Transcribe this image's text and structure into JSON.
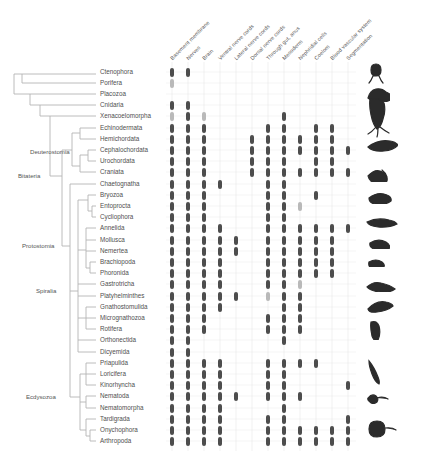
{
  "figure": {
    "type": "character-matrix-phylogeny",
    "colors": {
      "present": "#4d4d4d",
      "partial": "#b9b9b9",
      "tree": "#b0b0b0",
      "grid": "#e3e3e3",
      "text": "#4f4f4f",
      "silhouette": "#2b2b2b"
    }
  },
  "columns": [
    {
      "id": "basement-membrane",
      "label": "Basement membrane"
    },
    {
      "id": "nerves",
      "label": "Nerves"
    },
    {
      "id": "brain",
      "label": "Brain"
    },
    {
      "id": "ventral-nerve-cords",
      "label": "Ventral nerve cords"
    },
    {
      "id": "lateral-nerve-cords",
      "label": "Lateral nerve cords"
    },
    {
      "id": "dorsal-nerve-cords",
      "label": "Dorsal nerve cords"
    },
    {
      "id": "through-gut-anus",
      "label": "Through gut, anus"
    },
    {
      "id": "mesoderm",
      "label": "Mesoderm"
    },
    {
      "id": "nephridial-cells",
      "label": "Nephridial cells"
    },
    {
      "id": "coelom",
      "label": "Coelom"
    },
    {
      "id": "blood-vascular-system",
      "label": "Blood vascular system"
    },
    {
      "id": "segmentation",
      "label": "Segmentation"
    }
  ],
  "clades": [
    {
      "label": "Deuterostomia",
      "x": 30,
      "y": 152
    },
    {
      "label": "Bitateria",
      "x": 18,
      "y": 176
    },
    {
      "label": "Protostomia",
      "x": 22,
      "y": 246
    },
    {
      "label": "Spiralia",
      "x": 36,
      "y": 291
    },
    {
      "label": "Ecdysozoa",
      "x": 26,
      "y": 397
    }
  ],
  "taxa": [
    {
      "name": "Ctenophora",
      "y": 72,
      "states": [
        1,
        1,
        0,
        0,
        0,
        0,
        0,
        0,
        0,
        0,
        0,
        0
      ]
    },
    {
      "name": "Porifera",
      "y": 83,
      "states": [
        2,
        0,
        0,
        0,
        0,
        0,
        0,
        0,
        0,
        0,
        0,
        0
      ]
    },
    {
      "name": "Placozoa",
      "y": 94,
      "states": [
        0,
        0,
        0,
        0,
        0,
        0,
        0,
        0,
        0,
        0,
        0,
        0
      ]
    },
    {
      "name": "Cnidaria",
      "y": 105,
      "states": [
        1,
        1,
        0,
        0,
        0,
        0,
        0,
        0,
        0,
        0,
        0,
        0
      ]
    },
    {
      "name": "Xenacoelomorpha",
      "y": 116,
      "states": [
        2,
        1,
        2,
        0,
        0,
        0,
        0,
        1,
        0,
        0,
        0,
        0
      ]
    },
    {
      "name": "Echinodermata",
      "y": 128,
      "states": [
        1,
        1,
        1,
        0,
        0,
        0,
        1,
        1,
        0,
        1,
        1,
        0
      ]
    },
    {
      "name": "Hemichordata",
      "y": 139,
      "states": [
        1,
        1,
        1,
        0,
        0,
        1,
        1,
        1,
        1,
        1,
        1,
        0
      ]
    },
    {
      "name": "Cephalochordata",
      "y": 150,
      "states": [
        1,
        1,
        1,
        0,
        0,
        1,
        1,
        1,
        1,
        1,
        1,
        1
      ]
    },
    {
      "name": "Urochordata",
      "y": 161,
      "states": [
        1,
        1,
        1,
        0,
        0,
        1,
        1,
        1,
        0,
        1,
        1,
        0
      ]
    },
    {
      "name": "Craniata",
      "y": 172,
      "states": [
        1,
        1,
        1,
        0,
        0,
        1,
        1,
        1,
        1,
        1,
        1,
        1
      ]
    },
    {
      "name": "Chaetognatha",
      "y": 184,
      "states": [
        1,
        1,
        1,
        1,
        0,
        0,
        1,
        1,
        0,
        0,
        0,
        0
      ]
    },
    {
      "name": "Bryozoa",
      "y": 195,
      "states": [
        1,
        1,
        1,
        0,
        0,
        0,
        1,
        1,
        0,
        1,
        0,
        0
      ]
    },
    {
      "name": "Entoprocta",
      "y": 206,
      "states": [
        1,
        1,
        1,
        0,
        0,
        0,
        1,
        1,
        2,
        0,
        0,
        0
      ]
    },
    {
      "name": "Cycliophora",
      "y": 217,
      "states": [
        1,
        1,
        1,
        0,
        0,
        0,
        1,
        1,
        0,
        0,
        0,
        0
      ]
    },
    {
      "name": "Annelida",
      "y": 228,
      "states": [
        1,
        1,
        1,
        1,
        0,
        0,
        1,
        1,
        1,
        1,
        1,
        1
      ]
    },
    {
      "name": "Mollusca",
      "y": 240,
      "states": [
        1,
        1,
        1,
        1,
        1,
        0,
        1,
        1,
        1,
        1,
        1,
        0
      ]
    },
    {
      "name": "Nemertea",
      "y": 251,
      "states": [
        1,
        1,
        1,
        1,
        1,
        0,
        1,
        1,
        1,
        1,
        1,
        0
      ]
    },
    {
      "name": "Brachiopoda",
      "y": 262,
      "states": [
        1,
        1,
        1,
        1,
        0,
        0,
        1,
        1,
        1,
        1,
        1,
        0
      ]
    },
    {
      "name": "Phoronida",
      "y": 273,
      "states": [
        1,
        1,
        1,
        1,
        0,
        0,
        1,
        1,
        1,
        1,
        1,
        0
      ]
    },
    {
      "name": "Gastrotricha",
      "y": 284,
      "states": [
        1,
        1,
        1,
        1,
        0,
        0,
        1,
        1,
        2,
        0,
        0,
        0
      ]
    },
    {
      "name": "Platyhelminthes",
      "y": 296,
      "states": [
        1,
        1,
        1,
        1,
        1,
        0,
        2,
        1,
        1,
        0,
        0,
        0
      ]
    },
    {
      "name": "Gnathostomulida",
      "y": 307,
      "states": [
        1,
        1,
        1,
        1,
        0,
        0,
        0,
        1,
        1,
        0,
        0,
        0
      ]
    },
    {
      "name": "Micrognathozoa",
      "y": 318,
      "states": [
        1,
        1,
        1,
        0,
        0,
        0,
        1,
        1,
        1,
        0,
        0,
        0
      ]
    },
    {
      "name": "Rotifera",
      "y": 329,
      "states": [
        1,
        1,
        1,
        0,
        0,
        0,
        1,
        1,
        1,
        0,
        0,
        0
      ]
    },
    {
      "name": "Orthonectida",
      "y": 340,
      "states": [
        1,
        1,
        0,
        0,
        0,
        0,
        0,
        1,
        0,
        0,
        0,
        0
      ]
    },
    {
      "name": "Dicyemida",
      "y": 352,
      "states": [
        1,
        1,
        0,
        0,
        0,
        0,
        0,
        0,
        0,
        0,
        0,
        0
      ]
    },
    {
      "name": "Priapulida",
      "y": 363,
      "states": [
        1,
        1,
        1,
        1,
        0,
        0,
        1,
        1,
        1,
        1,
        0,
        0
      ]
    },
    {
      "name": "Loricifera",
      "y": 374,
      "states": [
        1,
        1,
        1,
        1,
        0,
        0,
        1,
        1,
        0,
        0,
        0,
        0
      ]
    },
    {
      "name": "Kinorhyncha",
      "y": 385,
      "states": [
        1,
        1,
        1,
        1,
        0,
        0,
        1,
        1,
        0,
        0,
        0,
        1
      ]
    },
    {
      "name": "Nematoda",
      "y": 396,
      "states": [
        1,
        1,
        1,
        1,
        1,
        0,
        1,
        1,
        1,
        0,
        0,
        0
      ]
    },
    {
      "name": "Nematomorpha",
      "y": 408,
      "states": [
        1,
        1,
        1,
        1,
        0,
        0,
        0,
        1,
        0,
        0,
        0,
        0
      ]
    },
    {
      "name": "Tardigrada",
      "y": 419,
      "states": [
        1,
        1,
        1,
        1,
        0,
        0,
        1,
        1,
        0,
        0,
        0,
        1
      ]
    },
    {
      "name": "Onychophora",
      "y": 430,
      "states": [
        1,
        1,
        1,
        1,
        0,
        0,
        1,
        1,
        1,
        1,
        1,
        1
      ]
    },
    {
      "name": "Arthropoda",
      "y": 441,
      "states": [
        1,
        1,
        1,
        1,
        0,
        0,
        1,
        1,
        1,
        1,
        1,
        1
      ]
    }
  ],
  "silhouettes": [
    {
      "name": "ctenophore-silhouette",
      "y": 74
    },
    {
      "name": "sponge-silhouette",
      "y": 94
    },
    {
      "name": "cnidarian-silhouette",
      "y": 118
    },
    {
      "name": "echinoderm-silhouette",
      "y": 145
    },
    {
      "name": "fish-silhouette",
      "y": 175
    },
    {
      "name": "crab-silhouette",
      "y": 197
    },
    {
      "name": "bryozoan-silhouette",
      "y": 222
    },
    {
      "name": "mollusc-silhouette",
      "y": 243
    },
    {
      "name": "snail-silhouette",
      "y": 262
    },
    {
      "name": "worm-silhouette",
      "y": 286
    },
    {
      "name": "flatworm-silhouette",
      "y": 307
    },
    {
      "name": "rotifer-silhouette",
      "y": 330
    },
    {
      "name": "nematode-silhouette",
      "y": 372
    },
    {
      "name": "tardigrade-silhouette",
      "y": 398
    },
    {
      "name": "arthropod-silhouette",
      "y": 430
    }
  ],
  "layout": {
    "column_x": [
      172,
      188,
      204,
      220,
      236,
      252,
      268,
      284,
      300,
      316,
      332,
      348
    ],
    "label_x": 100,
    "matrix_top": 62,
    "matrix_bottom": 451,
    "silhouette_x": 366
  }
}
